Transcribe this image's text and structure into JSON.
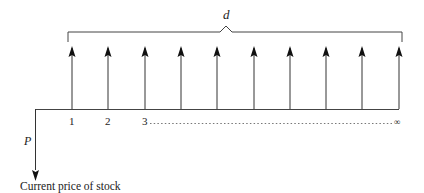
{
  "diagram": {
    "brace_label": "d",
    "periods": [
      "1",
      "2",
      "3"
    ],
    "infinity": "∞",
    "price_label": "P",
    "caption": "Current price of stock",
    "arrow_count": 10,
    "line_color": "#333333"
  }
}
